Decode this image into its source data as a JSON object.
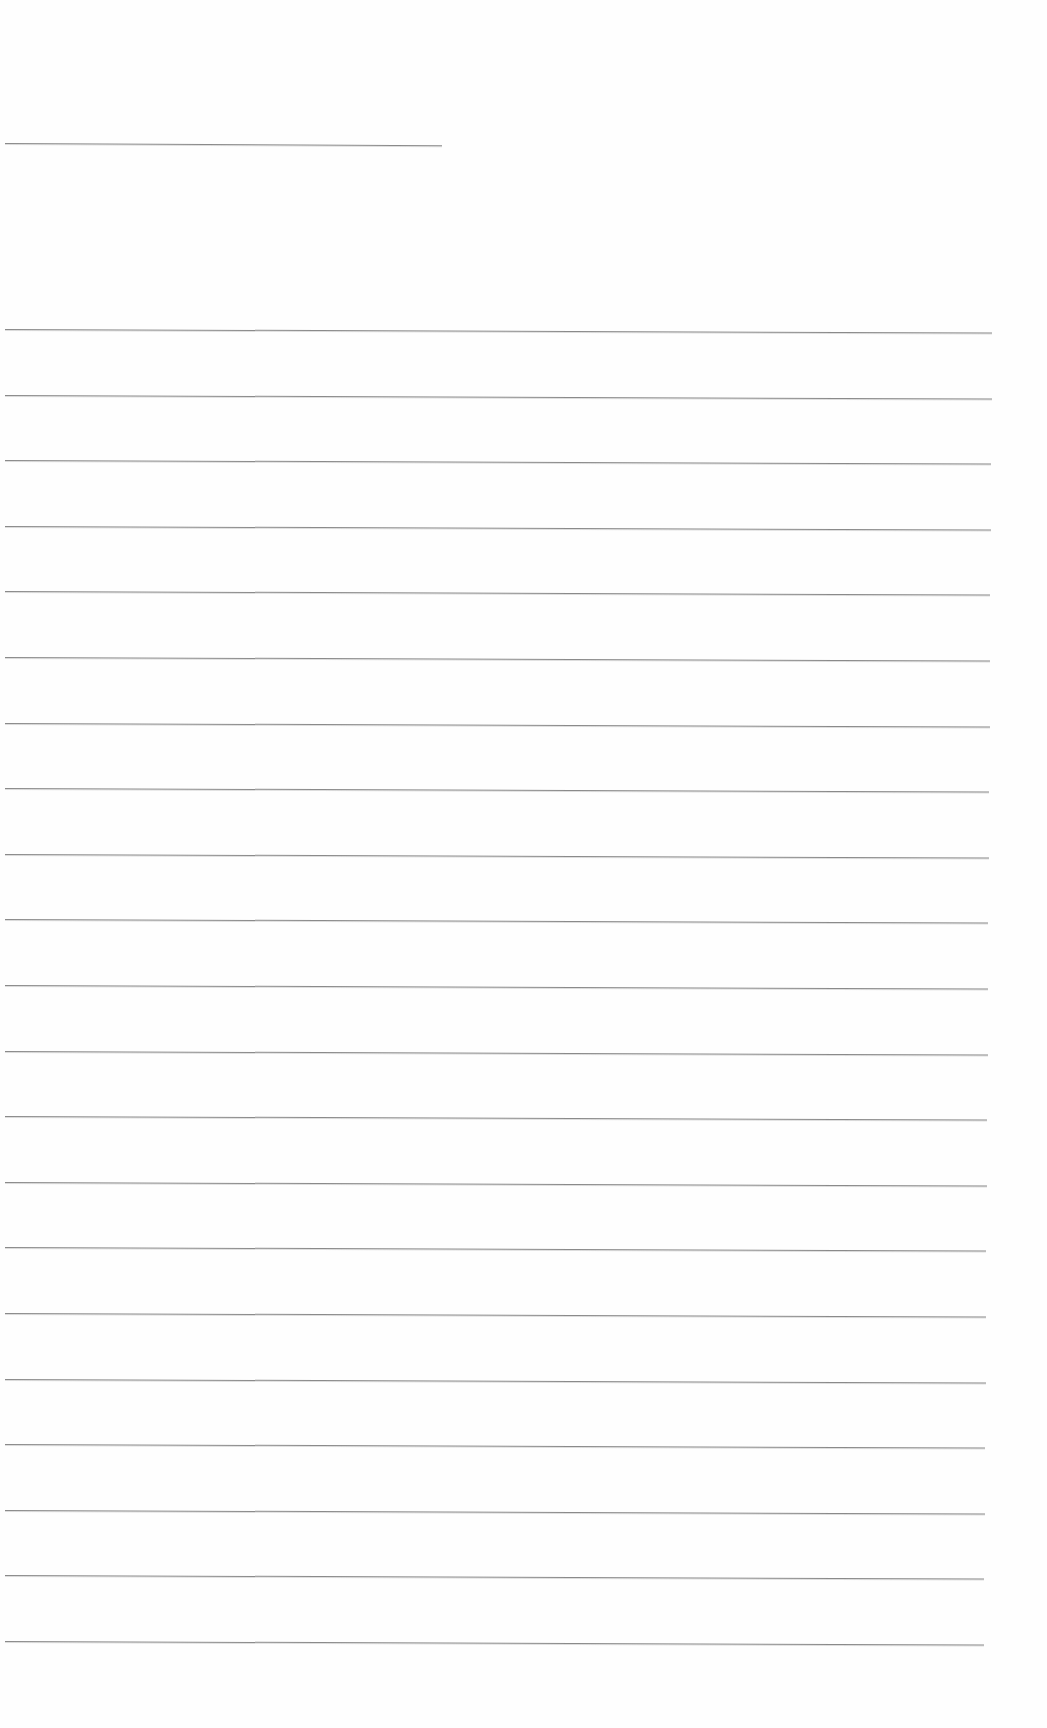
{
  "page": {
    "type": "blank lined sheet",
    "background": "#fefefe",
    "line_color": "#8a8a8a",
    "header_line": {
      "x": 5,
      "y": 143,
      "width": 437
    },
    "ruled_lines": {
      "count": 21,
      "first_y": 329,
      "spacing": 65.6,
      "x_start": 5,
      "x_end_top": 992,
      "x_end_bottom": 984
    }
  }
}
